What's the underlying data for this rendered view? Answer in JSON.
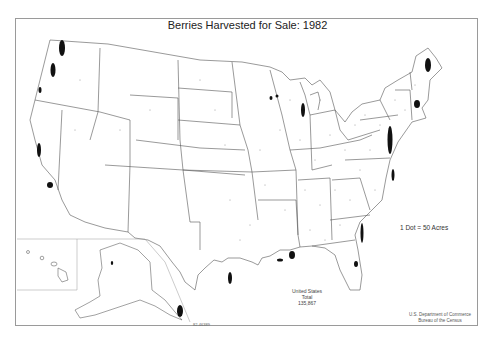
{
  "map": {
    "title": "Berries Harvested for Sale: 1982",
    "legend": "1 Dot = 50 Acres",
    "total": {
      "label_line1": "United States",
      "label_line2": "Total",
      "value": "135,867"
    },
    "credit": {
      "line1": "U.S. Department of Commerce",
      "line2": "Bureau of the Census"
    },
    "map_code": "82-46389",
    "colors": {
      "border": "#9a9a9a",
      "state_lines": "#555555",
      "dots": "#111111"
    },
    "regions": [
      "Contiguous United States",
      "Alaska inset",
      "Hawaii inset"
    ],
    "dense_areas": [
      "Western Washington",
      "Western Oregon",
      "Central California coast",
      "Southern California",
      "Western Michigan",
      "Northern Wisconsin",
      "Maine coast",
      "Massachusetts",
      "New Jersey / Delmarva",
      "North Carolina coast",
      "Georgia / Florida Atlantic coast",
      "Central Florida",
      "Gulf coast (Louisiana / Mississippi)",
      "Texas coast",
      "Southeast Alaska"
    ]
  }
}
